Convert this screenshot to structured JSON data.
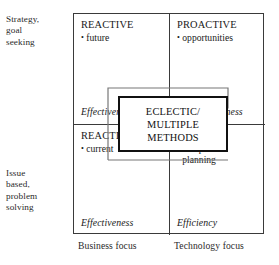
{
  "diagram": {
    "row_labels": [
      {
        "name": "strategy",
        "text": "Strategy,\ngoal\nseeking"
      },
      {
        "name": "issue",
        "text": "Issue\nbased,\nproblem\nsolving"
      }
    ],
    "column_labels": [
      {
        "name": "business",
        "text": "Business focus"
      },
      {
        "name": "technology",
        "text": "Technology focus"
      }
    ],
    "quadrants": [
      {
        "position": "top-left",
        "title": "REACTIVE",
        "bullet": "future",
        "bullet_marker": "•",
        "outcome": "Effectiveness"
      },
      {
        "position": "top-right",
        "title": "PROACTIVE",
        "bullet": "opportunities",
        "bullet_marker": "•",
        "outcome": "Competitiveness"
      },
      {
        "position": "bottom-left",
        "title": "REACTIVE",
        "bullet": "current",
        "bullet_marker": "•",
        "outcome": "Effectiveness"
      },
      {
        "position": "bottom-right",
        "title": "ISOLATED",
        "bullet": "computer\nplanning",
        "bullet_marker": "•",
        "outcome": "Efficiency"
      }
    ],
    "central_box": {
      "name": "eclectic-multiple-methods",
      "line1": "ECLECTIC/",
      "line2": "MULTIPLE",
      "line3": "METHODS"
    },
    "colors": {
      "frame": "#3a3a3a",
      "central_box_border": "#111111",
      "loop_line": "#777777",
      "arrow": "#111111",
      "text": "#1a1a1a",
      "background": "#ffffff"
    }
  }
}
